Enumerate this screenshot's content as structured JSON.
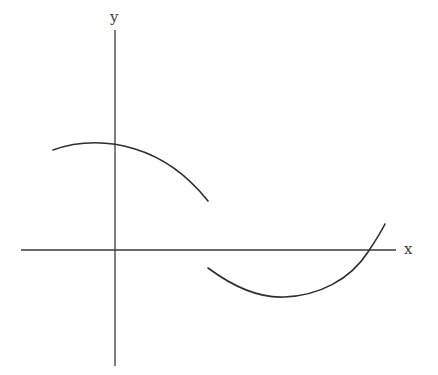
{
  "diagram": {
    "axes": {
      "x_label": "x",
      "y_label": "y"
    },
    "pieces": [
      {
        "name": "left-piece",
        "shape": "concave-down arc",
        "note": "starts left of y-axis, peaks near y-axis above origin, descends to the right ending above x-axis (open end)"
      },
      {
        "name": "right-piece",
        "shape": "concave-up arc",
        "note": "starts below x-axis at the discontinuity, dips to a minimum, rises and crosses x-axis near the right end"
      }
    ],
    "colors": {
      "stroke": "#2e2e2e",
      "background": "#ffffff"
    }
  }
}
